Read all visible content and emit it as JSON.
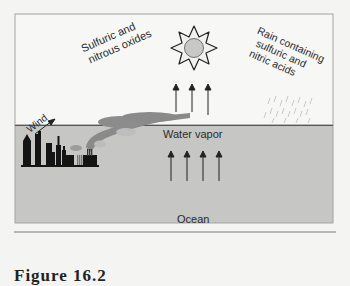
{
  "diagram": {
    "labels": {
      "emissions": [
        "Sulfuric and",
        "nitrous oxides"
      ],
      "wind": "Wind",
      "rain": [
        "Rain containing",
        "sulfuric and",
        "nitric acids"
      ],
      "water_vapor": "Water vapor",
      "ocean": "Ocean"
    },
    "caption": "Figure 16.2",
    "colors": {
      "sky": "#f7f7f5",
      "ocean": "#c4c4c2",
      "city": "#141414",
      "smoke_dark": "#8a8a8a",
      "smoke_light": "#bdbdbd",
      "sun_core": "#c8c8c8",
      "border": "#9a9a9a"
    },
    "icons": [
      "sun-icon",
      "city-skyline-icon",
      "factory-smoke-icon",
      "wind-arrow-icon",
      "evaporation-arrow-icon",
      "rain-icon"
    ]
  }
}
